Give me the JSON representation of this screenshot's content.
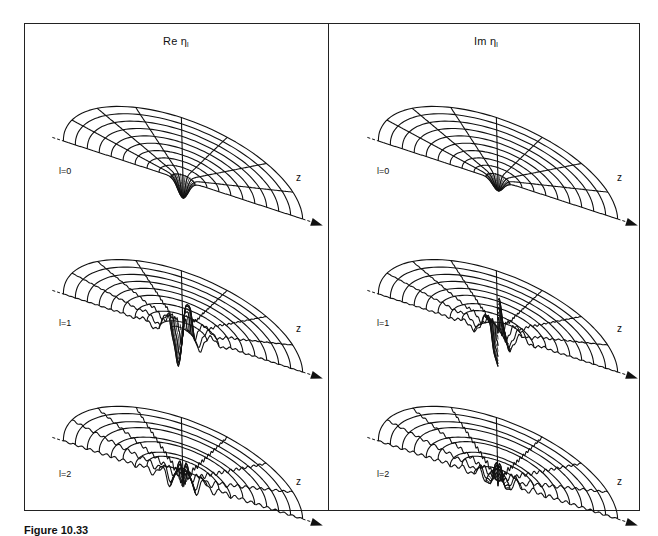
{
  "figure": {
    "caption": "Figure 10.33",
    "columns": [
      {
        "title_prefix": "Re ",
        "title_symbol": "η",
        "title_subscript": "l"
      },
      {
        "title_prefix": "Im ",
        "title_symbol": "η",
        "title_subscript": "l"
      }
    ],
    "rows": [
      {
        "label": "l=0"
      },
      {
        "label": "l=1"
      },
      {
        "label": "l=2"
      }
    ],
    "axis_label": "z",
    "colors": {
      "ink": "#111111",
      "background": "#ffffff"
    }
  }
}
